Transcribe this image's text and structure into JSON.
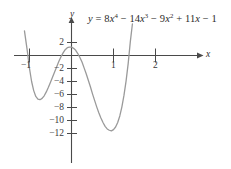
{
  "figure": {
    "equation_plain": "y = 8x^4 - 14x^3 - 9x^2 + 11x - 1",
    "equation_parts": {
      "lhs": "y",
      "eq": "=",
      "t1_coef": "8",
      "t1_var": "x",
      "t1_exp": "4",
      "op1": "−",
      "t2_coef": "14",
      "t2_var": "x",
      "t2_exp": "3",
      "op2": "−",
      "t3_coef": "9",
      "t3_var": "x",
      "t3_exp": "2",
      "op3": "+",
      "t4_coef": "11",
      "t4_var": "x",
      "op4": "−",
      "t5_const": "1"
    },
    "x_axis_name": "x",
    "y_axis_name": "y",
    "curve_color": "#9a9a9a",
    "axis_color": "#4a4a4a"
  },
  "chart_data": {
    "type": "line",
    "title": "",
    "subtitle": "",
    "xlabel": "x",
    "ylabel": "y",
    "annotations": [
      "y = 8x⁴ − 14x³ − 9x² + 11x − 1"
    ],
    "legend": [],
    "legend_position": "none",
    "grid": false,
    "xlim": [
      -1.25,
      2.1
    ],
    "ylim": [
      -13.0,
      3.2
    ],
    "x_ticks": [
      -1,
      1,
      2
    ],
    "x_tick_labels": [
      "−1",
      "1",
      "2"
    ],
    "y_ticks": [
      2,
      -2,
      -4,
      -6,
      -8,
      -10,
      -12
    ],
    "y_tick_labels": [
      "2",
      "−2",
      "−4",
      "−6",
      "−8",
      "−10",
      "−12"
    ],
    "function": "8*x**4 - 14*x**3 - 9*x**2 + 11*x - 1",
    "coefficients": [
      8,
      -14,
      -9,
      11,
      -1
    ],
    "features": {
      "local_min_left": {
        "x": -0.7,
        "y": -6.7
      },
      "local_max": {
        "x": 0.4,
        "y": 1.3
      },
      "local_min_right": {
        "x": 1.45,
        "y": -11.4
      },
      "roots_approx": [
        -1.07,
        0.1,
        0.95,
        1.78
      ]
    },
    "series": [
      {
        "name": "y = 8x^4 - 14x^3 - 9x^2 + 11x - 1",
        "color": "#9a9a9a",
        "x": [
          -1.12,
          -1.05,
          -1.0,
          -0.95,
          -0.9,
          -0.85,
          -0.8,
          -0.75,
          -0.7,
          -0.65,
          -0.6,
          -0.55,
          -0.5,
          -0.45,
          -0.4,
          -0.35,
          -0.3,
          -0.25,
          -0.2,
          -0.15,
          -0.1,
          -0.05,
          0.0,
          0.05,
          0.1,
          0.15,
          0.2,
          0.25,
          0.3,
          0.35,
          0.4,
          0.45,
          0.5,
          0.55,
          0.6,
          0.65,
          0.7,
          0.75,
          0.8,
          0.85,
          0.9,
          0.95,
          1.0,
          1.05,
          1.1,
          1.15,
          1.2,
          1.25,
          1.3,
          1.35,
          1.4,
          1.45,
          1.5,
          1.55,
          1.6,
          1.65,
          1.7,
          1.75,
          1.8,
          1.85,
          1.9,
          1.95,
          2.0,
          2.03
        ],
        "y": [
          3.8,
          0.6,
          -2.0,
          -4.0,
          -5.4,
          -6.3,
          -6.7,
          -6.8,
          -6.6,
          -6.2,
          -5.6,
          -4.9,
          -4.1,
          -3.3,
          -2.5,
          -1.7,
          -0.9,
          -0.2,
          0.4,
          0.9,
          1.2,
          1.3,
          1.3,
          1.1,
          0.8,
          0.3,
          -0.3,
          -1.0,
          -1.9,
          -2.8,
          -3.8,
          -4.8,
          -5.9,
          -6.9,
          -7.9,
          -8.8,
          -9.6,
          -10.3,
          -10.9,
          -11.3,
          -11.5,
          -11.6,
          -11.4,
          -11.0,
          -10.3,
          -9.3,
          -7.9,
          -6.1,
          -3.9,
          -1.2,
          2.1,
          6.0,
          10.5,
          15.8,
          21.8,
          28.7,
          36.4,
          45.1,
          54.8,
          65.5,
          77.4,
          90.4,
          104.6,
          113.6
        ]
      }
    ]
  }
}
